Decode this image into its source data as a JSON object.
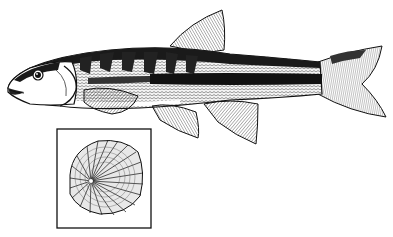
{
  "illustration": {
    "subject": "fish-lateral-view",
    "inset": "fish-scale-detail",
    "colors": {
      "ink": "#111111",
      "paper": "#ffffff",
      "midtone": "#555555",
      "light": "#bbbbbb"
    }
  }
}
